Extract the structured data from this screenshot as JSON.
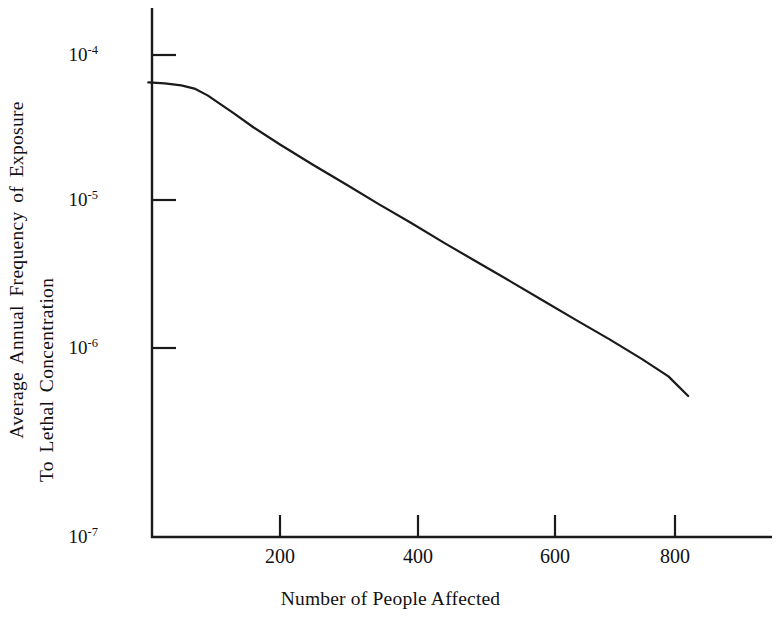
{
  "chart_data": {
    "type": "line",
    "title": "",
    "xlabel": "Number of People Affected",
    "ylabel_line1": "Average  Annual  Frequency  of  Exposure",
    "ylabel_line2": "To Lethal Concentration",
    "yscale": "log",
    "xscale": "linear",
    "xlim": [
      0,
      900
    ],
    "ylim": [
      1e-07,
      0.00014
    ],
    "grid": false,
    "legend": null,
    "xticks": [
      200,
      400,
      600,
      800
    ],
    "xtick_labels": [
      "200",
      "400",
      "600",
      "800"
    ],
    "yticks": [
      0.0001,
      1e-05,
      1e-06,
      1e-07
    ],
    "ytick_labels": [
      "10-4",
      "10-5",
      "10-6",
      "10-7"
    ],
    "ytick_mantissa": "10",
    "ytick_exponents": [
      "-4",
      "-5",
      "-6",
      "-7"
    ],
    "series": [
      {
        "name": "Frequency-Number exceedance curve",
        "color": "#1a1a1a",
        "linewidth": 2.2,
        "x": [
          0,
          25,
          50,
          70,
          90,
          110,
          130,
          160,
          200,
          250,
          300,
          350,
          400,
          450,
          500,
          550,
          600,
          650,
          700,
          750,
          790,
          820
        ],
        "y": [
          6.5e-05,
          6.4e-05,
          6.2e-05,
          5.9e-05,
          5.3e-05,
          4.6e-05,
          4e-05,
          3.2e-05,
          2.45e-05,
          1.78e-05,
          1.31e-05,
          9.6e-06,
          7.1e-06,
          5.2e-06,
          3.85e-06,
          2.85e-06,
          2.1e-06,
          1.55e-06,
          1.15e-06,
          8.4e-07,
          6.4e-07,
          4.7e-07
        ]
      }
    ],
    "annotations": []
  },
  "axis": {
    "y_axis_name": "y-axis-line",
    "x_axis_name": "x-axis-line"
  }
}
